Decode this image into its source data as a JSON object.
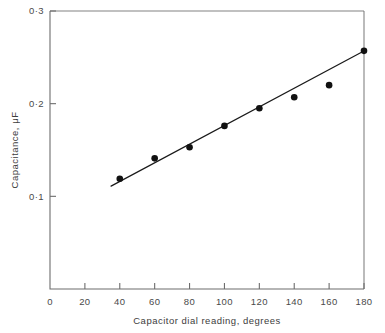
{
  "chart_data": {
    "type": "scatter",
    "title": "",
    "xlabel": "Capacitor dial reading, degrees",
    "ylabel": "Capacitance, μF",
    "xlim": [
      0,
      180
    ],
    "ylim": [
      0,
      0.3
    ],
    "grid": false,
    "legend": "none",
    "x_ticks": [
      0,
      20,
      40,
      60,
      80,
      100,
      120,
      140,
      160,
      180
    ],
    "x_tick_labels": [
      "0",
      "20",
      "40",
      "60",
      "80",
      "100",
      "120",
      "140",
      "160",
      "180"
    ],
    "y_ticks": [
      0.1,
      0.2,
      0.3
    ],
    "y_tick_labels": [
      "0·1",
      "0·2",
      "0·3"
    ],
    "x": [
      40,
      60,
      80,
      100,
      120,
      140,
      160,
      180
    ],
    "values": [
      0.119,
      0.141,
      0.153,
      0.176,
      0.195,
      0.207,
      0.22,
      0.257
    ],
    "series": [
      {
        "name": "Measured capacitance",
        "marker": "filled-circle",
        "color": "#111111",
        "points": [
          {
            "x": 40,
            "y": 0.119
          },
          {
            "x": 60,
            "y": 0.141
          },
          {
            "x": 80,
            "y": 0.153
          },
          {
            "x": 100,
            "y": 0.176
          },
          {
            "x": 120,
            "y": 0.195
          },
          {
            "x": 140,
            "y": 0.207
          },
          {
            "x": 160,
            "y": 0.22
          },
          {
            "x": 180,
            "y": 0.257
          }
        ]
      },
      {
        "name": "Best-fit straight line",
        "marker": "none",
        "color": "#1a1a1a",
        "line_endpoints": [
          {
            "x": 35,
            "y": 0.111
          },
          {
            "x": 181,
            "y": 0.258
          }
        ]
      }
    ]
  },
  "axes": {
    "y_label": "Capacitance, μF",
    "x_label": "Capacitor dial reading, degrees"
  }
}
